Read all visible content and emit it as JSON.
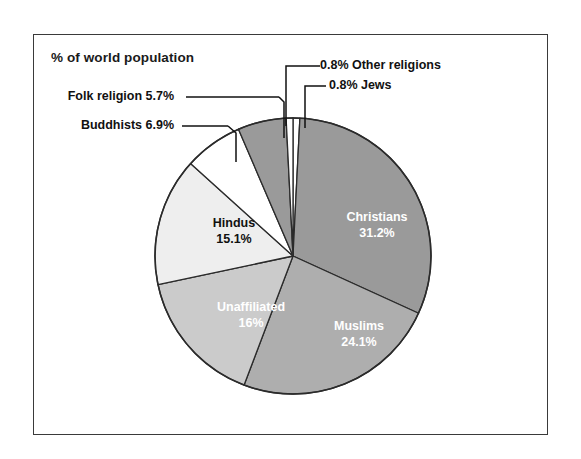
{
  "figure": {
    "title": "% of world population",
    "background_color": "#ffffff",
    "frame_color": "#3a3a3a"
  },
  "chart_data": {
    "type": "pie",
    "title": "% of world population",
    "xlabel": "",
    "ylabel": "",
    "unit": "percent of world population",
    "start_angle_deg": 0,
    "direction": "clockwise",
    "legend": "none",
    "grid": false,
    "categories": [
      "Other religions",
      "Christians",
      "Muslims",
      "Unaffiliated",
      "Hindus",
      "Buddhists",
      "Folk religion",
      "Jews"
    ],
    "values": [
      0.8,
      31.2,
      24.1,
      16,
      15.1,
      6.9,
      5.7,
      0.8
    ],
    "slices": [
      {
        "name": "Other religions",
        "value": 0.8,
        "label": "0.8% Other religions",
        "value_text": "0.8%",
        "color": "#ffffff",
        "label_placement": "outside",
        "label_color": "#111111"
      },
      {
        "name": "Christians",
        "value": 31.2,
        "label": "Christians",
        "value_text": "31.2%",
        "color": "#9a9a9a",
        "label_placement": "inside",
        "label_color": "#ffffff"
      },
      {
        "name": "Muslims",
        "value": 24.1,
        "label": "Muslims",
        "value_text": "24.1%",
        "color": "#aeaeae",
        "label_placement": "inside",
        "label_color": "#ffffff"
      },
      {
        "name": "Unaffiliated",
        "value": 16,
        "label": "Unaffiliated",
        "value_text": "16%",
        "color": "#cbcbcb",
        "label_placement": "inside",
        "label_color": "#ffffff"
      },
      {
        "name": "Hindus",
        "value": 15.1,
        "label": "Hindus",
        "value_text": "15.1%",
        "color": "#eeeeee",
        "label_placement": "inside",
        "label_color": "#111111"
      },
      {
        "name": "Buddhists",
        "value": 6.9,
        "label": "Buddhists 6.9%",
        "value_text": "6.9%",
        "color": "#ffffff",
        "label_placement": "outside",
        "label_color": "#111111"
      },
      {
        "name": "Folk religion",
        "value": 5.7,
        "label": "Folk religion 5.7%",
        "value_text": "5.7%",
        "color": "#9a9a9a",
        "label_placement": "outside",
        "label_color": "#111111"
      },
      {
        "name": "Jews",
        "value": 0.8,
        "label": "0.8% Jews",
        "value_text": "0.8%",
        "color": "#ffffff",
        "label_placement": "outside",
        "label_color": "#111111"
      }
    ]
  },
  "labels": {
    "christians_name": "Christians",
    "christians_value": "31.2%",
    "muslims_name": "Muslims",
    "muslims_value": "24.1%",
    "unaffiliated_name": "Unaffiliated",
    "unaffiliated_value": "16%",
    "hindus_name": "Hindus",
    "hindus_value": "15.1%",
    "buddhists_callout": "Buddhists 6.9%",
    "folk_callout": "Folk religion 5.7%",
    "other_callout": "0.8% Other religions",
    "jews_callout": "0.8% Jews"
  }
}
